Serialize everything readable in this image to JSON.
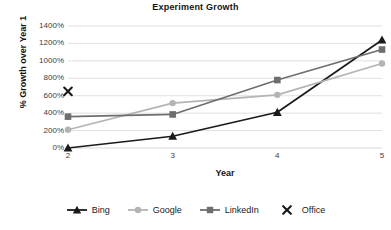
{
  "chart_data": {
    "type": "line",
    "title": "Experiment Growth",
    "xlabel": "Year",
    "ylabel": "% Growth over Year 1",
    "x": [
      2,
      3,
      4,
      5
    ],
    "xticklabels": [
      "2",
      "3",
      "4",
      "5"
    ],
    "yticklabels": [
      "0%",
      "200%",
      "400%",
      "600%",
      "800%",
      "1000%",
      "1200%",
      "1400%"
    ],
    "ytickvalues": [
      0,
      200,
      400,
      600,
      800,
      1000,
      1200,
      1400
    ],
    "ylim": [
      0,
      1400
    ],
    "ytick_step": 200,
    "grid": "horizontal",
    "legend_position": "bottom",
    "series": [
      {
        "name": "Bing",
        "marker": "triangle",
        "color": "#1a1a1a",
        "values": [
          0,
          135,
          410,
          1240
        ]
      },
      {
        "name": "Google",
        "marker": "circle",
        "color": "#b4b4b4",
        "values": [
          210,
          515,
          610,
          970
        ]
      },
      {
        "name": "LinkedIn",
        "marker": "square",
        "color": "#6e6e6e",
        "values": [
          360,
          385,
          780,
          1130
        ]
      },
      {
        "name": "Office",
        "marker": "x",
        "color": "#1a1a1a",
        "values": [
          650,
          null,
          null,
          null
        ]
      }
    ]
  },
  "legend": {
    "items": [
      {
        "label": "Bing"
      },
      {
        "label": "Google"
      },
      {
        "label": "LinkedIn"
      },
      {
        "label": "Office"
      }
    ]
  },
  "colors": {
    "bing": "#1a1a1a",
    "google": "#b4b4b4",
    "linkedin": "#6e6e6e",
    "office": "#1a1a1a",
    "gridline": "#d8d8d8",
    "text": "#1a1a1a"
  }
}
